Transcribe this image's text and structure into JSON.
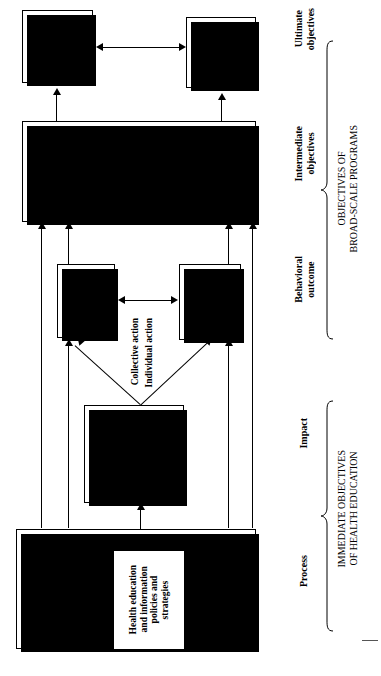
{
  "diagram": {
    "orientation": "rotated-90-ccw"
  },
  "boxes": {
    "economic_goals": {
      "text": "Economic\nand social\ngoals and\nneeds"
    },
    "health_needs": {
      "text": "Health\nneeds\nand\ngoals"
    },
    "development_sectors": {
      "text": "Development\nsectors (e.g.,\ncommunity\ndevelopment,\neducation)"
    },
    "health_services": {
      "text": "Health services,\nhealth protection,\nand health\npromotion\nobjectives"
    },
    "community_participation": {
      "text": "Community\nparticipation\nobjectives"
    },
    "individual_participation": {
      "text": "Individual\nand family\nparticipation\nobjectives"
    },
    "health_education_objectives": {
      "text": "Health education\nobjectives (e.g.,\npredisposing,\nenabling, and\nreinforcing\nfactors)"
    },
    "community_social_policies": {
      "text": "Community social\nand economic\ndevelopmental\npolicies and\nstrategies"
    },
    "health_education_policies": {
      "text": "Health education\nand information\npolicies and\nstrategies"
    },
    "community_health_policies": {
      "text": "Community\nhealth policies\nand strategies"
    }
  },
  "labels": {
    "collective_action": "Collective action",
    "individual_action": "Individual action"
  },
  "stages": {
    "ultimate": "Ultimate\nobjectives",
    "intermediate": "Intermediate\nobjectives",
    "behavioral": "Behavioral\noutcome",
    "impact": "Impact",
    "process": "Process"
  },
  "groupings": {
    "broad_scale": "OBJECTIVES OF\nBROAD-SCALE PROGRAMS",
    "health_education": "IMMEDIATE OBJECTIVES\nOF HEALTH EDUCATION"
  },
  "colors": {
    "ink": "#000000",
    "paper": "#ffffff",
    "shadow": "#000000"
  }
}
